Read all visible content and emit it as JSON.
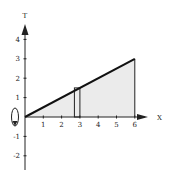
{
  "chart_data": {
    "type": "area",
    "title": "",
    "xlabel": "X",
    "ylabel": "T",
    "xlim": [
      0,
      6.5
    ],
    "ylim": [
      -2.5,
      4.7
    ],
    "x_ticks": [
      1,
      2,
      3,
      4,
      5,
      6
    ],
    "x_tick_labels": [
      "1",
      "2",
      "3",
      "4",
      "5",
      "6"
    ],
    "y_ticks": [
      -2,
      -1,
      1,
      2,
      3,
      4
    ],
    "y_tick_labels": [
      "-2",
      "-1",
      "1",
      "2",
      "3",
      "4"
    ],
    "grid": false,
    "series": [
      {
        "name": "T = x/2",
        "x": [
          0,
          6
        ],
        "y": [
          0,
          3
        ],
        "shaded_below": true,
        "vertical_edge_at_x": 6
      }
    ],
    "annotations": [
      {
        "type": "rectangle-strip",
        "x_from": 2.7,
        "x_to": 3.0,
        "y_from": 0,
        "y_to": 1.5,
        "description": "thin vertical strip under the line"
      },
      {
        "type": "rotation-arrow",
        "about": "horizontal axis",
        "at_x": 0,
        "description": "curved arrow indicating rotation about the x-axis"
      }
    ],
    "shade_color": "#ebebeb",
    "line_color": "#111111"
  }
}
